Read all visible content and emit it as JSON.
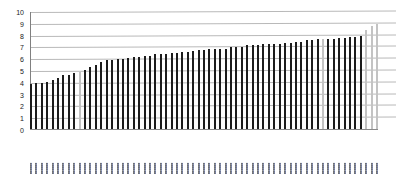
{
  "chart_data": {
    "type": "bar",
    "title": "",
    "subtitle": "",
    "xlabel": "",
    "ylabel": "",
    "ylim": [
      0,
      10
    ],
    "yticks": [
      10,
      9,
      8,
      7,
      6,
      5,
      4,
      3,
      2,
      1,
      0
    ],
    "grid": true,
    "grid_axis": "y",
    "legend": false,
    "legend_position": "none",
    "sorted": "ascending",
    "bar_color": "#1c1c1c",
    "highlight_color": "#c3c3c3",
    "highlight_indices": [
      9,
      54,
      62,
      63,
      64
    ],
    "annotations": [],
    "note": "x-axis category labels are rendered at sub-pixel size in the source scan and are not legible",
    "categories": [
      "",
      "",
      "",
      "",
      "",
      "",
      "",
      "",
      "",
      "",
      "",
      "",
      "",
      "",
      "",
      "",
      "",
      "",
      "",
      "",
      "",
      "",
      "",
      "",
      "",
      "",
      "",
      "",
      "",
      "",
      "",
      "",
      "",
      "",
      "",
      "",
      "",
      "",
      "",
      "",
      "",
      "",
      "",
      "",
      "",
      "",
      "",
      "",
      "",
      "",
      "",
      "",
      "",
      "",
      "",
      "",
      "",
      "",
      "",
      "",
      "",
      "",
      "",
      "",
      ""
    ],
    "values": [
      3.9,
      4.0,
      4.0,
      4.1,
      4.2,
      4.4,
      4.7,
      4.7,
      4.8,
      4.9,
      5.1,
      5.3,
      5.5,
      5.8,
      5.9,
      5.9,
      6.0,
      6.0,
      6.1,
      6.2,
      6.2,
      6.3,
      6.3,
      6.4,
      6.4,
      6.4,
      6.5,
      6.5,
      6.6,
      6.6,
      6.7,
      6.8,
      6.8,
      6.9,
      6.9,
      6.9,
      6.9,
      7.0,
      7.0,
      7.0,
      7.2,
      7.2,
      7.2,
      7.3,
      7.3,
      7.3,
      7.3,
      7.4,
      7.4,
      7.5,
      7.5,
      7.6,
      7.6,
      7.7,
      7.7,
      7.7,
      7.7,
      7.8,
      7.8,
      7.9,
      7.9,
      8.0,
      8.5,
      8.8,
      9.0
    ]
  }
}
